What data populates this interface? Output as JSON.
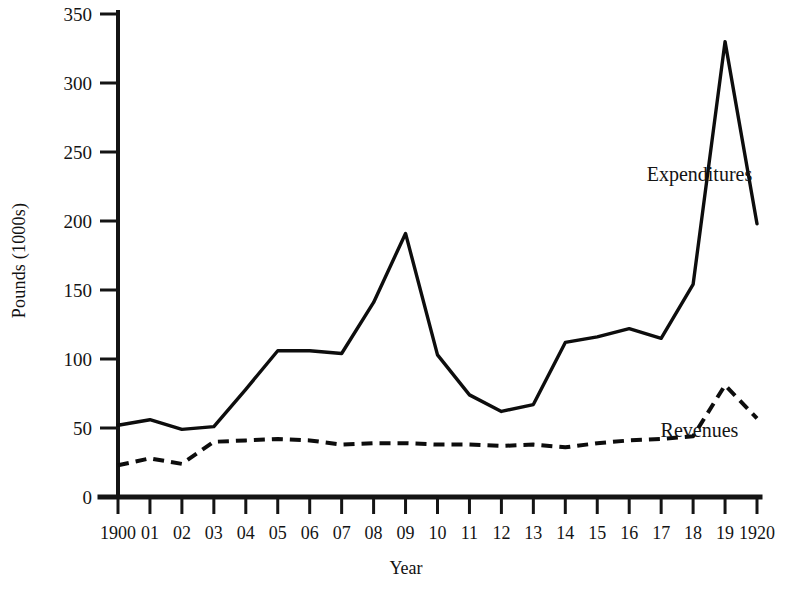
{
  "chart_data": {
    "type": "line",
    "title": "",
    "xlabel": "Year",
    "ylabel": "Pounds (1000s)",
    "x": [
      1900,
      1901,
      1902,
      1903,
      1904,
      1905,
      1906,
      1907,
      1908,
      1909,
      1910,
      1911,
      1912,
      1913,
      1914,
      1915,
      1916,
      1917,
      1918,
      1919,
      1920
    ],
    "xticklabels": [
      "1900",
      "01",
      "02",
      "03",
      "04",
      "05",
      "06",
      "07",
      "08",
      "09",
      "10",
      "11",
      "12",
      "13",
      "14",
      "15",
      "16",
      "17",
      "18",
      "19",
      "1920"
    ],
    "yticklabels": [
      "0",
      "50",
      "100",
      "150",
      "200",
      "250",
      "300",
      "350"
    ],
    "yticks": [
      0,
      50,
      100,
      150,
      200,
      250,
      300,
      350
    ],
    "xlim": [
      1900,
      1920
    ],
    "ylim": [
      0,
      350
    ],
    "grid": false,
    "legend_position": "inline-annotation",
    "series": [
      {
        "name": "Expenditures",
        "style": "solid",
        "values": [
          52,
          56,
          49,
          51,
          78,
          106,
          106,
          104,
          141,
          191,
          103,
          74,
          62,
          67,
          112,
          116,
          122,
          115,
          154,
          330,
          198
        ]
      },
      {
        "name": "Revenues",
        "style": "dashed",
        "values": [
          23,
          28,
          24,
          40,
          41,
          42,
          41,
          38,
          39,
          39,
          38,
          38,
          37,
          38,
          36,
          39,
          41,
          42,
          44,
          81,
          57
        ]
      }
    ],
    "annotations": [
      {
        "text": "Expenditures",
        "x": 1918.2,
        "y": 233
      },
      {
        "text": "Revenues",
        "x": 1918.2,
        "y": 48
      }
    ],
    "colors": {
      "line": "#0d0d0d",
      "axis": "#141414",
      "background": "#ffffff"
    }
  }
}
